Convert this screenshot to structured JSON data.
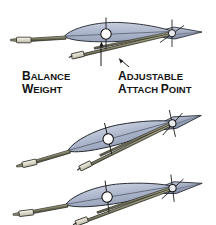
{
  "figure": {
    "title": "",
    "background_color": "#ffffff",
    "callouts": [
      {
        "id": "balance-weight",
        "line1": "B",
        "line1_rest": "ALANCE",
        "line2": "W",
        "line2_rest": "EIGHT",
        "full_text": "BALANCE WEIGHT",
        "text_color": "#141414",
        "leader_from": [
          100,
          67
        ],
        "leader_to": [
          102,
          45
        ]
      },
      {
        "id": "adjustable-attach-point",
        "line1": "A",
        "line1_rest": "DJUSTABLE",
        "line2": "A",
        "line2_rest": "TTACH ",
        "line2_cap2": "P",
        "line2_rest2": "OINT",
        "full_text": "ADJUSTABLE ATTACH POINT",
        "text_color": "#141414",
        "leader_from": [
          121,
          66
        ],
        "leader_to": [
          110,
          56
        ]
      }
    ],
    "colors": {
      "wing_fill": "#aab4ca",
      "wing_fill_light": "#c3cbdc",
      "wing_stroke": "#20242c",
      "boom_fill": "#6a6a52",
      "boom_fill_light": "#8f8f72",
      "boom_stroke": "#22231c",
      "weight_fill": "#d6d3c2",
      "weight_stroke": "#2a2a24",
      "strut_fill": "#b8b49a",
      "pivot_fill": "#ffffff",
      "pivot_stroke": "#1a1a1a",
      "crosshair_stroke": "#1a1a1a",
      "tail_fill": "#9aa5bb"
    },
    "views": [
      {
        "id": "view-level",
        "label": "level",
        "rotation_deg": 0,
        "attach_point_position": "forward",
        "origin": [
          0,
          0
        ]
      },
      {
        "id": "view-nose-down",
        "label": "nose-down",
        "rotation_deg": -13,
        "attach_point_position": "mid",
        "origin": [
          0,
          78
        ]
      },
      {
        "id": "view-nose-up",
        "label": "nose-up",
        "rotation_deg": -7,
        "attach_point_position": "aft",
        "origin": [
          0,
          155
        ]
      }
    ],
    "parts": [
      {
        "name": "wing-airfoil",
        "description": "main wing airfoil planform"
      },
      {
        "name": "balance-weight-block",
        "description": "rectangular weight at nose boom tip"
      },
      {
        "name": "nose-boom",
        "description": "long tube from wing leading edge to balance weight"
      },
      {
        "name": "main-pivot",
        "description": "circular pivot at wing mid chord"
      },
      {
        "name": "tail-surface",
        "description": "pointed tail / elevator at right"
      },
      {
        "name": "tail-pivot",
        "description": "small circular pivot at tail"
      },
      {
        "name": "control-strut",
        "description": "diagonal strut from attach point to tail pivot"
      },
      {
        "name": "attach-point-slider",
        "description": "adjustable slider block on lower strut"
      }
    ]
  }
}
